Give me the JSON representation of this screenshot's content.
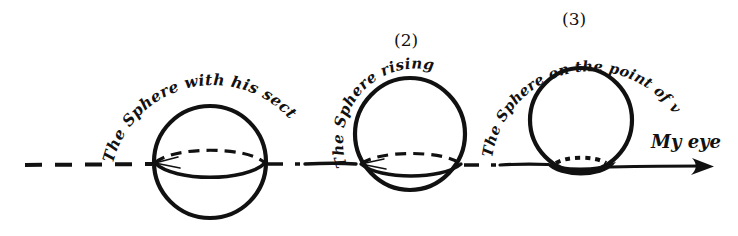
{
  "figure": {
    "background_color": "#ffffff",
    "ink_color": "#111111",
    "baseline_label": "horizontal plane line",
    "eye_label": "My eye",
    "arrow_direction": "right"
  },
  "stages": [
    {
      "number": "",
      "caption": "The Sphere with his section at full Size",
      "caption_words": [
        "The",
        "Sphere",
        "with",
        "his",
        "section",
        "at",
        "full",
        "Size"
      ],
      "sphere": {
        "cx": 210,
        "cy": 162,
        "r": 56,
        "section_style": "dashed-back-solid-front",
        "position_note": "centre on the line"
      }
    },
    {
      "number": "(2)",
      "caption": "The Sphere rising",
      "caption_words": [
        "The",
        "Sphere",
        "rising"
      ],
      "sphere": {
        "cx": 410,
        "cy": 133,
        "r": 56,
        "section_style": "dashed-back-solid-front",
        "position_note": "mostly above the line"
      }
    },
    {
      "number": "(3)",
      "caption": "The Sphere on the point of vanishing",
      "caption_words": [
        "The",
        "Sphere",
        "on",
        "the",
        "point",
        "of",
        "vanishing"
      ],
      "sphere": {
        "cx": 581,
        "cy": 120,
        "r": 51,
        "section_style": "small-dark-lens",
        "position_note": "tangent to the line"
      }
    }
  ],
  "baseline": {
    "y": 164,
    "left_dashed_start_x": 25,
    "arrow_tip_x": 712
  }
}
